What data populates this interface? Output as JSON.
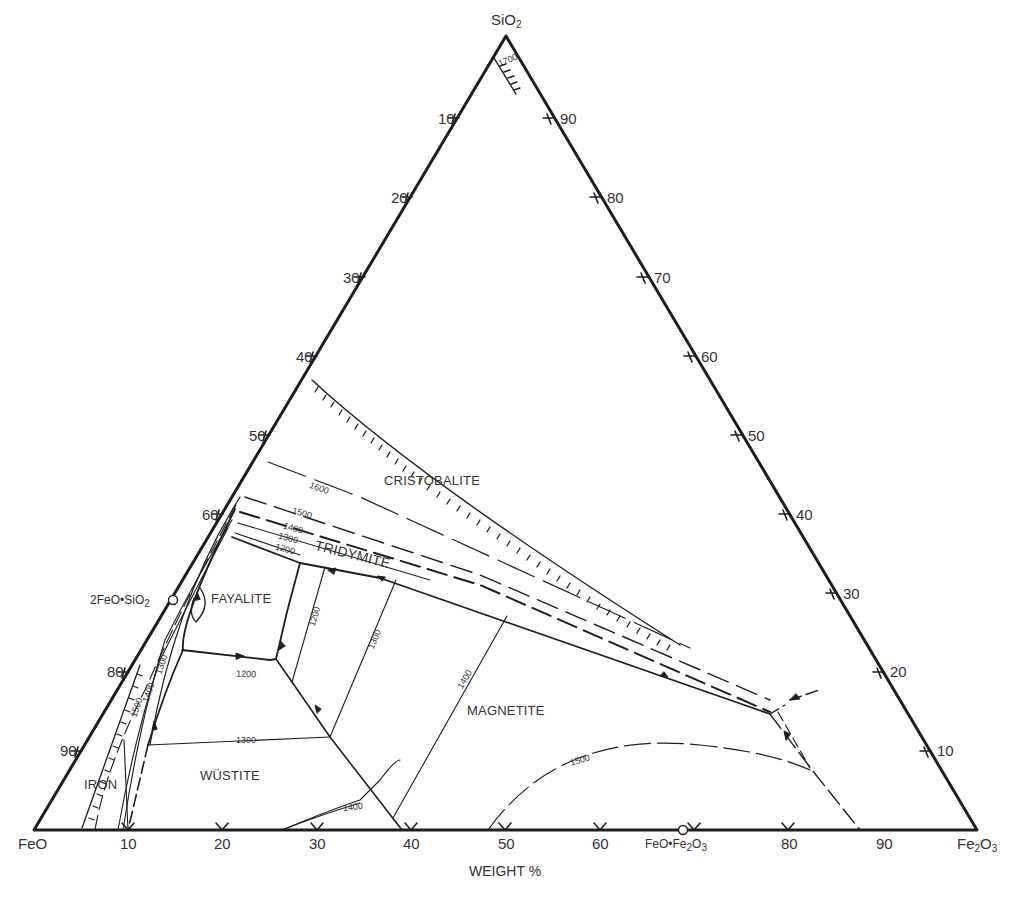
{
  "diagram": {
    "type": "ternary-phase-diagram",
    "xlabel": "WEIGHT %",
    "vertices": {
      "top": {
        "name": "SiO",
        "sub": "2"
      },
      "left": {
        "name": "FeO"
      },
      "right": {
        "name": "Fe",
        "sub": "2",
        "name2": "O",
        "sub2": "3"
      }
    },
    "bottom_axis_ticks": [
      "10",
      "20",
      "30",
      "40",
      "50",
      "60",
      "80",
      "90"
    ],
    "left_axis_ticks": [
      "10",
      "20",
      "30",
      "40",
      "50",
      "60",
      "80",
      "90"
    ],
    "right_axis_ticks": [
      "90",
      "80",
      "70",
      "60",
      "50",
      "40",
      "30",
      "20",
      "10"
    ],
    "compounds": [
      {
        "label": "2FeO•SiO",
        "sub": "2"
      },
      {
        "label": "FeO•Fe",
        "sub": "2",
        "label2": "O",
        "sub2": "3"
      }
    ],
    "phase_fields": {
      "cristobalite": "CRISTOBALITE",
      "tridymite": "TRIDYMITE",
      "fayalite": "FAYALITE",
      "magnetite": "MAGNETITE",
      "wustite": "WÜSTITE",
      "iron": "IRON"
    },
    "isotherms": {
      "t1700": "1700",
      "t1600": "1600",
      "t1500_top": "1500",
      "t1400_top": "1400",
      "t1300_top": "1300",
      "t1200_top": "1200",
      "t1200_fay": "1200",
      "t1200_vert": "1200",
      "t1300_vert": "1300",
      "t1400_vert": "1400",
      "t1300_left": "1300",
      "t1400_left": "1400",
      "t1500_left": "1500",
      "t1300_wus": "1300",
      "t1400_bottom": "1400",
      "t1500_mag": "1500"
    },
    "colors": {
      "line": "#1e1e1e",
      "text": "#333333",
      "background": "#ffffff"
    }
  }
}
